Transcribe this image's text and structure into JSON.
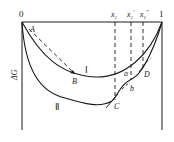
{
  "diagram": {
    "type": "free-energy-composition",
    "axis": {
      "left_label": "0",
      "right_label": "1",
      "y_label": "ΔG"
    },
    "compositions": [
      {
        "id": "x1",
        "label": "x",
        "sub": "1",
        "sup": ""
      },
      {
        "id": "x1p",
        "label": "x",
        "sub": "1",
        "sup": "′"
      },
      {
        "id": "x1pp",
        "label": "x",
        "sub": "1",
        "sup": "″"
      }
    ],
    "curves": [
      {
        "id": "curve-I",
        "label": "Ⅰ"
      },
      {
        "id": "curve-II",
        "label": "Ⅱ"
      }
    ],
    "points": {
      "A": "A",
      "B": "B",
      "C": "C",
      "D": "D",
      "a": "a",
      "b": "b",
      "tick": "'"
    },
    "colors": {
      "line": "#1a1a1a",
      "background": "#ffffff"
    }
  }
}
